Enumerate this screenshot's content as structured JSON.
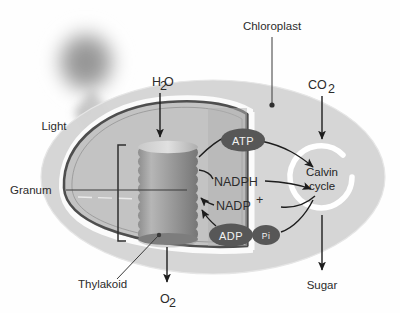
{
  "figure": {
    "type": "biology-diagram"
  },
  "labels": {
    "light": "Light",
    "water": "H",
    "water_sub": "2",
    "water_tail": "O",
    "chloroplast": "Chloroplast",
    "carbon_dioxide": "CO",
    "carbon_dioxide_sub": "2",
    "granum": "Granum",
    "thylakoid": "Thylakoid",
    "oxygen": "O",
    "oxygen_sub": "2",
    "sugar": "Sugar"
  },
  "molecules": {
    "atp": "ATP",
    "adp": "ADP",
    "pi": "Pi",
    "nadph": "NADPH",
    "nadp": "NADP",
    "nadp_sup": "+"
  },
  "calvin": {
    "line1": "Calvin",
    "line2": "cycle"
  },
  "colors": {
    "stroma": "#d2d2d2",
    "stroma_dark": "#bdbdbd",
    "envelope": "#4d4d4d",
    "envelope_halo": "#f7f7f7",
    "oval_fill": "#575757",
    "oval_text": "#f2f2f2",
    "granum_disc": "#9a9a9a",
    "granum_disc_edge": "#d8d8d8",
    "light_glow": "#9e9e9e",
    "label_text": "#2b2b2b",
    "arrow": "#1d1d1d",
    "calvin_ring": "#ffffff"
  }
}
